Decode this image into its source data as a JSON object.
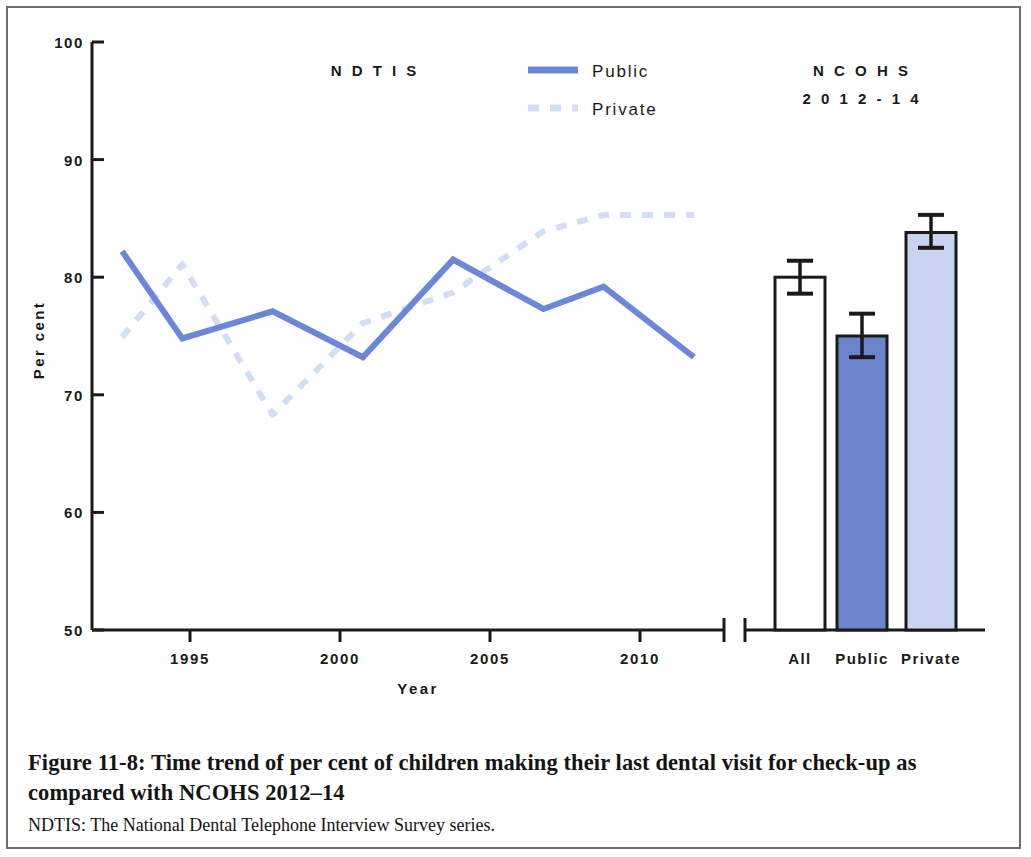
{
  "figure": {
    "caption_title": "Figure 11-8: Time trend of per cent of children making their last dental visit for check-up as compared with NCOHS 2012–14",
    "caption_note": "NDTIS: The National Dental Telephone Interview Survey series."
  },
  "colors": {
    "public_line": "#6B87D8",
    "private_line": "#D3DDF4",
    "bar_all_fill": "#FFFFFF",
    "bar_public_fill": "#6B84CC",
    "bar_private_fill": "#C8D4F0",
    "axis": "#1a1a1a",
    "frame": "#6e6e6e"
  },
  "legend": {
    "public_label": "Public",
    "private_label": "Private"
  },
  "panels": {
    "line_panel_title": "N D T I S",
    "bar_panel_title_line1": "N C O H S",
    "bar_panel_title_line2": "2 0 1 2 - 1 4"
  },
  "chart_data": {
    "type": "line",
    "title": "Time trend of per cent of children making their last dental visit for check-up as compared with NCOHS 2012–14",
    "xlabel": "Year",
    "ylabel": "Per cent",
    "ylim": [
      50,
      100
    ],
    "yticks": [
      50,
      60,
      70,
      80,
      90,
      100
    ],
    "ytick_labels": [
      "50",
      "60",
      "70",
      "80",
      "90",
      "100"
    ],
    "xlim": [
      1993,
      2014
    ],
    "xticks": [
      1995,
      2000,
      2005,
      2010
    ],
    "xtick_labels": [
      "1995",
      "2000",
      "2005",
      "2010"
    ],
    "grid": false,
    "legend_position": "top-center",
    "series": [
      {
        "name": "Public",
        "style": "solid",
        "color": "#6B87D8",
        "x": [
          1994,
          1996,
          1999,
          2002,
          2005,
          2008,
          2010,
          2013
        ],
        "values": [
          82.2,
          74.8,
          77.1,
          73.2,
          81.5,
          77.3,
          79.2,
          73.2
        ]
      },
      {
        "name": "Private",
        "style": "dashed",
        "color": "#D3DDF4",
        "x": [
          1994,
          1996,
          1999,
          2002,
          2005,
          2008,
          2010,
          2013
        ],
        "values": [
          74.9,
          81.1,
          68.3,
          76.1,
          78.7,
          83.9,
          85.3,
          85.3
        ]
      }
    ]
  },
  "chart_data_bars": {
    "type": "bar",
    "title": "NCOHS 2012-14",
    "ylabel": "Per cent",
    "ylim": [
      50,
      100
    ],
    "categories": [
      "All",
      "Public",
      "Private"
    ],
    "values": [
      80.0,
      75.0,
      83.8
    ],
    "error_low": [
      78.6,
      73.2,
      82.5
    ],
    "error_high": [
      81.4,
      76.9,
      85.3
    ],
    "colors": [
      "#FFFFFF",
      "#6B84CC",
      "#C8D4F0"
    ]
  },
  "axis_labels": {
    "y_title": "Per cent",
    "x_title": "Year",
    "y_ticks": [
      "100",
      "90",
      "80",
      "70",
      "60",
      "50"
    ],
    "x_ticks": [
      "1995",
      "2000",
      "2005",
      "2010"
    ],
    "bar_cats": [
      "All",
      "Public",
      "Private"
    ]
  }
}
